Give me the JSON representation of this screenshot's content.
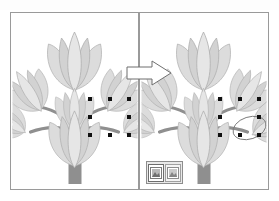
{
  "figure": {
    "title": "",
    "kind": "before-after-illustration"
  },
  "colors": {
    "panel_border": "#9a9a9a",
    "canvas_background": "#ffffff",
    "flower_petal_light": "#dcdcdc",
    "flower_petal_mid": "#c6c6c6",
    "flower_outline": "#a8a8a8",
    "trunk": "#8f8f8f",
    "branch": "#8f8f8f",
    "handle": "#111111",
    "arrow_fill": "#ffffff",
    "arrow_outline": "#6f6f6f",
    "popup_background": "#e9e9e9",
    "popup_border": "#8d8d8d"
  },
  "panels": [
    {
      "id": "before",
      "name": "before-panel",
      "label": "",
      "tree": {
        "name": "stylized-tree-graphic",
        "trunk_color": "#8f8f8f",
        "flower_count": 9
      },
      "selection": {
        "name": "selection-handles",
        "visible": true,
        "handle_count": 8,
        "handles": [
          {
            "x": 88,
            "y": 97
          },
          {
            "x": 108,
            "y": 97
          },
          {
            "x": 127,
            "y": 97
          },
          {
            "x": 88,
            "y": 115
          },
          {
            "x": 127,
            "y": 115
          },
          {
            "x": 88,
            "y": 133
          },
          {
            "x": 108,
            "y": 133
          },
          {
            "x": 127,
            "y": 133
          }
        ]
      }
    },
    {
      "id": "after",
      "name": "after-panel",
      "label": "",
      "tree": {
        "name": "stylized-tree-graphic",
        "trunk_color": "#8f8f8f",
        "flower_count": 9
      },
      "selection": {
        "name": "selection-handles",
        "visible": true,
        "handle_count": 8,
        "handles": [
          {
            "x": 218,
            "y": 97
          },
          {
            "x": 238,
            "y": 97
          },
          {
            "x": 257,
            "y": 97
          },
          {
            "x": 218,
            "y": 115
          },
          {
            "x": 257,
            "y": 115
          },
          {
            "x": 218,
            "y": 133
          },
          {
            "x": 238,
            "y": 133
          },
          {
            "x": 257,
            "y": 133
          }
        ]
      },
      "popup": {
        "name": "paste-options-popup",
        "visible": true,
        "buttons": [
          {
            "name": "paste-option-keep-source-formatting",
            "label": "",
            "selected": true,
            "glyph": "▤"
          },
          {
            "name": "paste-option-picture",
            "label": "",
            "selected": false,
            "glyph": "▤"
          }
        ]
      }
    }
  ],
  "arrow": {
    "name": "transition-arrow",
    "direction": "right",
    "label": ""
  }
}
